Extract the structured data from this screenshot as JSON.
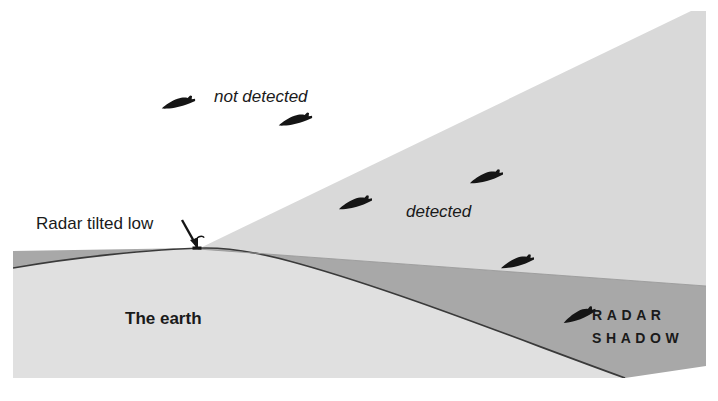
{
  "figure": {
    "width": 718,
    "height": 401
  },
  "labels": {
    "not_detected": "not detected",
    "detected": "detected",
    "radar_tilted_low": "Radar tilted low",
    "the_earth": "The earth",
    "radar_shadow_line1": "R A D A R",
    "radar_shadow_line2": "S H A D O W",
    "radar_shadow_word1": "RADAR",
    "radar_shadow_word2": "SHADOW"
  },
  "colors": {
    "background": "#ffffff",
    "beam_fill": "#d9d9d9",
    "earth_fill": "#e0e0e0",
    "shadow_fill": "#a8a8a8",
    "outline": "#3a3a3a",
    "aircraft": "#151515",
    "text": "#1a1a1a"
  },
  "geometry": {
    "radar_apex": {
      "x": 198,
      "y": 249
    },
    "beam_upper_edge_end": {
      "x": 691,
      "y": 11
    },
    "beam_lower_edge_end": {
      "x": 706,
      "y": 286
    },
    "earth_left": {
      "x": 13,
      "y": 266
    },
    "earth_crest": {
      "x": 230,
      "y": 248
    },
    "earth_right_bottom": {
      "x": 625,
      "y": 378
    },
    "shadow_origin": {
      "x": 381,
      "y": 276
    },
    "frame": {
      "left": 13,
      "top": 11,
      "right": 706,
      "bottom": 378
    }
  },
  "aircraft": [
    {
      "name": "aircraft-not-detected-1",
      "x": 180,
      "y": 103,
      "rotation": -12,
      "scale": 1.0,
      "zone": "not-detected"
    },
    {
      "name": "aircraft-not-detected-2",
      "x": 297,
      "y": 120,
      "rotation": -12,
      "scale": 1.0,
      "zone": "not-detected"
    },
    {
      "name": "aircraft-detected-1",
      "x": 357,
      "y": 203,
      "rotation": -14,
      "scale": 1.0,
      "zone": "detected"
    },
    {
      "name": "aircraft-detected-2",
      "x": 488,
      "y": 177,
      "rotation": -14,
      "scale": 1.0,
      "zone": "detected"
    },
    {
      "name": "aircraft-detected-3",
      "x": 519,
      "y": 262,
      "rotation": -14,
      "scale": 1.0,
      "zone": "detected"
    },
    {
      "name": "aircraft-in-shadow",
      "x": 581,
      "y": 315,
      "rotation": -20,
      "scale": 1.0,
      "zone": "radar-shadow"
    }
  ],
  "annotations": {
    "radar_pointer_arrow": {
      "from": {
        "x": 183,
        "y": 222
      },
      "to": {
        "x": 198,
        "y": 247
      }
    },
    "radar_antenna": {
      "x": 197,
      "y": 249
    }
  }
}
